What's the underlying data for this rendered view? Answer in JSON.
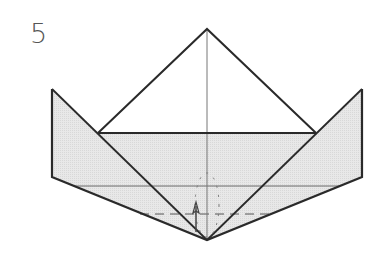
{
  "step": {
    "number": "5"
  },
  "diagram": {
    "colors": {
      "fill": "#e6e6e6",
      "stroke": "#2a2a2a",
      "thin_line": "#666666",
      "dashed_line": "#555555"
    },
    "symbols": {
      "arrow": "up-arrow",
      "dotted_circle": "pivot-marker"
    }
  }
}
